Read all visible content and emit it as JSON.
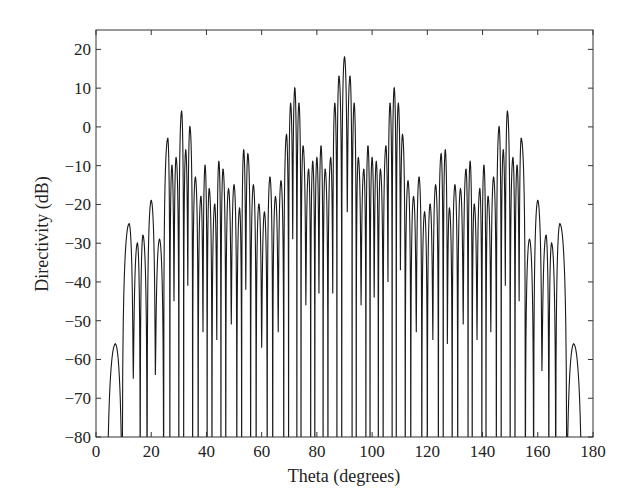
{
  "chart_data": {
    "type": "line",
    "title": "",
    "xlabel": "Theta (degrees)",
    "ylabel": "Directivity (dB)",
    "xlim": [
      0,
      180
    ],
    "ylim": [
      -80,
      25
    ],
    "xticks": [
      0,
      20,
      40,
      60,
      80,
      100,
      120,
      140,
      160,
      180
    ],
    "yticks": [
      20,
      10,
      0,
      -10,
      -20,
      -30,
      -40,
      -50,
      -60,
      -70,
      -80
    ],
    "grid": false,
    "legend": null,
    "symmetric_about": 90,
    "series": [
      {
        "name": "Directivity pattern",
        "color": "#1a1a1a",
        "lobe_peaks_left_half": [
          {
            "theta": 7,
            "db": -56
          },
          {
            "theta": 12,
            "db": -25
          },
          {
            "theta": 15,
            "db": -30
          },
          {
            "theta": 17,
            "db": -28
          },
          {
            "theta": 20,
            "db": -19
          },
          {
            "theta": 23,
            "db": -29
          },
          {
            "theta": 26,
            "db": -3
          },
          {
            "theta": 27.5,
            "db": -10
          },
          {
            "theta": 29,
            "db": -8
          },
          {
            "theta": 31,
            "db": 4
          },
          {
            "theta": 32.5,
            "db": -6
          },
          {
            "theta": 34,
            "db": 0
          },
          {
            "theta": 36,
            "db": -13
          },
          {
            "theta": 38,
            "db": -18
          },
          {
            "theta": 39.5,
            "db": -10
          },
          {
            "theta": 41,
            "db": -16
          },
          {
            "theta": 43,
            "db": -20
          },
          {
            "theta": 44.5,
            "db": -9
          },
          {
            "theta": 46,
            "db": -11
          },
          {
            "theta": 48,
            "db": -16
          },
          {
            "theta": 50,
            "db": -15
          },
          {
            "theta": 52,
            "db": -21
          },
          {
            "theta": 53.5,
            "db": -6
          },
          {
            "theta": 55,
            "db": -7
          },
          {
            "theta": 57,
            "db": -15
          },
          {
            "theta": 59,
            "db": -20
          },
          {
            "theta": 61,
            "db": -22
          },
          {
            "theta": 63,
            "db": -13
          },
          {
            "theta": 65,
            "db": -18
          },
          {
            "theta": 67,
            "db": -14
          },
          {
            "theta": 69,
            "db": -2
          },
          {
            "theta": 70.5,
            "db": 6
          },
          {
            "theta": 72,
            "db": 10
          },
          {
            "theta": 73.5,
            "db": 6
          },
          {
            "theta": 75,
            "db": -5
          },
          {
            "theta": 77,
            "db": -11
          },
          {
            "theta": 78.5,
            "db": -9
          },
          {
            "theta": 80,
            "db": -8
          },
          {
            "theta": 81.5,
            "db": -5
          },
          {
            "theta": 83,
            "db": -11
          },
          {
            "theta": 85,
            "db": -8
          },
          {
            "theta": 86.5,
            "db": 6
          },
          {
            "theta": 88,
            "db": 13
          },
          {
            "theta": 90,
            "db": 18
          }
        ]
      }
    ]
  }
}
